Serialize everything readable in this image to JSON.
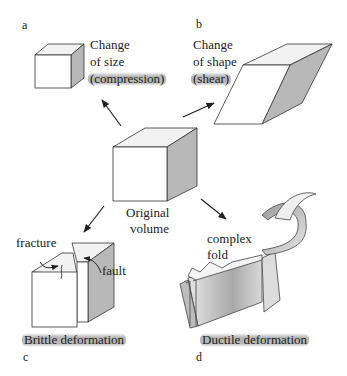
{
  "figure": {
    "panels": {
      "a": {
        "letter": "a",
        "caption_lines": [
          "Change",
          "of size",
          "(compression)"
        ],
        "highlight": "compression"
      },
      "b": {
        "letter": "b",
        "caption_lines": [
          "Change",
          "of shape",
          "(shear)"
        ],
        "highlight": "shear"
      },
      "center": {
        "caption_lines": [
          "Original",
          "volume"
        ]
      },
      "c": {
        "letter": "c",
        "caption": "Brittle deformation",
        "annotations": [
          "fracture",
          "fault"
        ]
      },
      "d": {
        "letter": "d",
        "caption": "Ductile deformation",
        "annotations_lines": [
          "complex",
          "fold"
        ]
      }
    },
    "colors": {
      "face_front": "#ffffff",
      "face_top": "#f2f2f2",
      "face_side": "#b8b8b8",
      "outline": "#333333",
      "highlight": "#a0a0a0"
    }
  }
}
